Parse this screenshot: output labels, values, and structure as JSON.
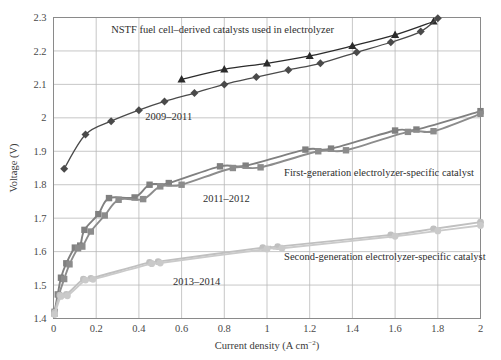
{
  "chart_data": {
    "type": "line",
    "title": "",
    "xlabel": "Current density (A cm−2)",
    "ylabel": "Voltage (V)",
    "xlim": [
      0,
      2
    ],
    "ylim": [
      1.4,
      2.3
    ],
    "xticks": [
      "0",
      "0.2",
      "0.4",
      "0.6",
      "0.8",
      "1",
      "1.2",
      "1.4",
      "1.6",
      "1.8",
      "2"
    ],
    "xtick_values": [
      0,
      0.2,
      0.4,
      0.6,
      0.8,
      1.0,
      1.2,
      1.4,
      1.6,
      1.8,
      2.0
    ],
    "yticks": [
      "1.4",
      "1.5",
      "1.6",
      "1.7",
      "1.8",
      "1.9",
      "2",
      "2.1",
      "2.2",
      "2.3"
    ],
    "ytick_values": [
      1.4,
      1.5,
      1.6,
      1.7,
      1.8,
      1.9,
      2.0,
      2.1,
      2.2,
      2.3
    ],
    "grid": true,
    "legend_position": "inline-annotations",
    "series": [
      {
        "name": "NSTF 2009-2011 triangle",
        "marker": "triangle",
        "color": "#2b2b2b",
        "points": [
          [
            0.6,
            2.115
          ],
          [
            0.8,
            2.145
          ],
          [
            1.0,
            2.163
          ],
          [
            1.2,
            2.185
          ],
          [
            1.4,
            2.215
          ],
          [
            1.6,
            2.248
          ],
          [
            1.78,
            2.288
          ]
        ]
      },
      {
        "name": "NSTF 2009-2011 diamond",
        "marker": "diamond",
        "color": "#4a4a4a",
        "points": [
          [
            0.05,
            1.848
          ],
          [
            0.15,
            1.95
          ],
          [
            0.27,
            1.99
          ],
          [
            0.4,
            2.023
          ],
          [
            0.52,
            2.049
          ],
          [
            0.66,
            2.074
          ],
          [
            0.8,
            2.1
          ],
          [
            0.95,
            2.122
          ],
          [
            1.1,
            2.143
          ],
          [
            1.25,
            2.163
          ],
          [
            1.42,
            2.196
          ],
          [
            1.58,
            2.226
          ],
          [
            1.72,
            2.258
          ],
          [
            1.8,
            2.298
          ]
        ]
      },
      {
        "name": "First-generation 2011-2012 upper",
        "marker": "square",
        "color": "#808080",
        "points": [
          [
            0.005,
            1.42
          ],
          [
            0.02,
            1.472
          ],
          [
            0.035,
            1.522
          ],
          [
            0.06,
            1.565
          ],
          [
            0.1,
            1.612
          ],
          [
            0.125,
            1.618
          ],
          [
            0.145,
            1.665
          ],
          [
            0.21,
            1.712
          ],
          [
            0.26,
            1.76
          ],
          [
            0.38,
            1.762
          ],
          [
            0.45,
            1.8
          ],
          [
            0.54,
            1.805
          ],
          [
            0.78,
            1.855
          ],
          [
            0.9,
            1.857
          ],
          [
            1.18,
            1.905
          ],
          [
            1.3,
            1.908
          ],
          [
            1.6,
            1.962
          ],
          [
            1.7,
            1.965
          ],
          [
            2.0,
            2.02
          ]
        ]
      },
      {
        "name": "First-generation 2011-2012 lower",
        "marker": "square",
        "color": "#8c8c8c",
        "points": [
          [
            0.005,
            1.415
          ],
          [
            0.025,
            1.47
          ],
          [
            0.05,
            1.518
          ],
          [
            0.075,
            1.562
          ],
          [
            0.115,
            1.61
          ],
          [
            0.135,
            1.615
          ],
          [
            0.175,
            1.66
          ],
          [
            0.24,
            1.708
          ],
          [
            0.305,
            1.755
          ],
          [
            0.42,
            1.757
          ],
          [
            0.5,
            1.795
          ],
          [
            0.6,
            1.8
          ],
          [
            0.84,
            1.85
          ],
          [
            0.97,
            1.852
          ],
          [
            1.24,
            1.9
          ],
          [
            1.37,
            1.903
          ],
          [
            1.66,
            1.958
          ],
          [
            1.78,
            1.96
          ],
          [
            2.0,
            2.012
          ]
        ]
      },
      {
        "name": "Second-generation 2013-2014 upper",
        "marker": "circle",
        "color": "#c0c0c0",
        "points": [
          [
            0.005,
            1.418
          ],
          [
            0.03,
            1.47
          ],
          [
            0.06,
            1.472
          ],
          [
            0.14,
            1.518
          ],
          [
            0.175,
            1.52
          ],
          [
            0.45,
            1.568
          ],
          [
            0.49,
            1.57
          ],
          [
            0.98,
            1.612
          ],
          [
            1.05,
            1.615
          ],
          [
            1.58,
            1.65
          ],
          [
            1.78,
            1.668
          ],
          [
            2.0,
            1.688
          ]
        ]
      },
      {
        "name": "Second-generation 2013-2014 lower",
        "marker": "circle",
        "color": "#cacaca",
        "points": [
          [
            0.005,
            1.412
          ],
          [
            0.035,
            1.466
          ],
          [
            0.065,
            1.468
          ],
          [
            0.15,
            1.515
          ],
          [
            0.185,
            1.517
          ],
          [
            0.46,
            1.564
          ],
          [
            0.5,
            1.566
          ],
          [
            1.0,
            1.608
          ],
          [
            1.07,
            1.61
          ],
          [
            1.6,
            1.646
          ],
          [
            1.8,
            1.662
          ],
          [
            2.0,
            1.678
          ]
        ]
      }
    ],
    "annotations": [
      {
        "text": "NSTF fuel cell–derived catalysts used in electrolyzer",
        "x": 0.27,
        "y": 2.255,
        "anchor": "start"
      },
      {
        "text": "2009–2011",
        "x": 0.43,
        "y": 1.995,
        "anchor": "start"
      },
      {
        "text": "First-generation electrolyzer-specific catalyst",
        "x": 1.08,
        "y": 1.825,
        "anchor": "start"
      },
      {
        "text": "2011–2012",
        "x": 0.7,
        "y": 1.748,
        "anchor": "start"
      },
      {
        "text": "Second-generation electrolyzer-specific catalyst",
        "x": 1.08,
        "y": 1.575,
        "anchor": "start"
      },
      {
        "text": "2013–2014",
        "x": 0.56,
        "y": 1.5,
        "anchor": "start"
      }
    ]
  },
  "axes": {
    "y_title": "Voltage (V)",
    "x_title_main": "Current density (A cm",
    "x_title_sup": "−2",
    "x_title_tail": ")"
  },
  "colors": {
    "grid": "#b9b9b9",
    "axis": "#8a8a8a",
    "text": "#3a3a3a",
    "series_dark": "#2b2b2b",
    "series_dark2": "#4a4a4a",
    "series_mid": "#808080",
    "series_light": "#c0c0c0"
  }
}
